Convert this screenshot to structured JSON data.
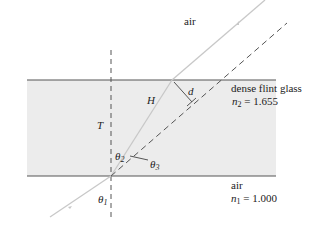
{
  "diagram": {
    "type": "refraction-through-glass-slab",
    "regions": {
      "top_medium": "air",
      "slab_medium": "dense flint glass",
      "slab_index_label": "n",
      "slab_index_sub": "2",
      "slab_index_value": "= 1.655",
      "bottom_medium": "air",
      "bottom_index_label": "n",
      "bottom_index_sub": "1",
      "bottom_index_value": "= 1.000"
    },
    "labels": {
      "path_length": "H",
      "thickness": "T",
      "lateral_displacement": "d",
      "incidence_angle": "θ",
      "incidence_angle_sub": "1",
      "refraction_angle": "θ",
      "refraction_angle_sub": "2",
      "deviation_angle": "θ",
      "deviation_angle_sub": "3"
    },
    "colors": {
      "glass_fill": "#ececec",
      "surface_line": "#555555",
      "ray": "#c8c8c8",
      "dashed": "#555555"
    }
  }
}
